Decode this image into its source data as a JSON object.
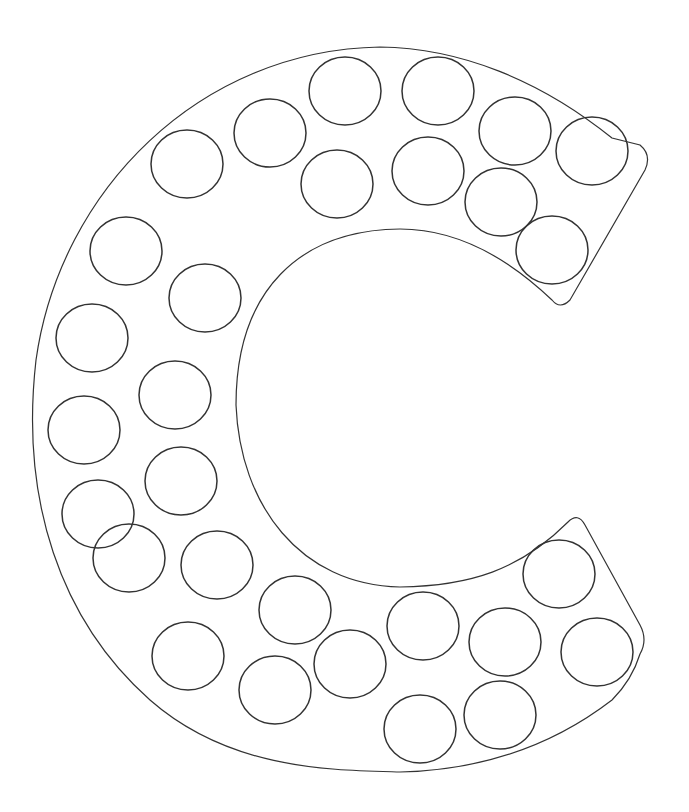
{
  "worksheet": {
    "letter": "C",
    "stroke_color": "#333333",
    "background": "#ffffff",
    "dots": [
      [
        345,
        91
      ],
      [
        438,
        91
      ],
      [
        515,
        131
      ],
      [
        592,
        151
      ],
      [
        270,
        133
      ],
      [
        187,
        164
      ],
      [
        337,
        184
      ],
      [
        428,
        171
      ],
      [
        501,
        202
      ],
      [
        552,
        250
      ],
      [
        126,
        251
      ],
      [
        205,
        298
      ],
      [
        92,
        338
      ],
      [
        175,
        395
      ],
      [
        84,
        430
      ],
      [
        181,
        481
      ],
      [
        98,
        514
      ],
      [
        129,
        558
      ],
      [
        217,
        565
      ],
      [
        295,
        610
      ],
      [
        188,
        656
      ],
      [
        275,
        690
      ],
      [
        350,
        664
      ],
      [
        423,
        626
      ],
      [
        505,
        642
      ],
      [
        559,
        574
      ],
      [
        597,
        652
      ],
      [
        420,
        729
      ],
      [
        500,
        715
      ]
    ]
  }
}
